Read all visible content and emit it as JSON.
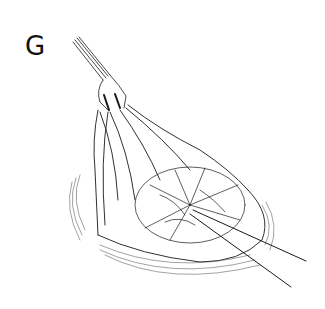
{
  "figure": {
    "panel_label": "G",
    "colors": {
      "background": "#ffffff",
      "ink": "#1a1a1a"
    }
  }
}
